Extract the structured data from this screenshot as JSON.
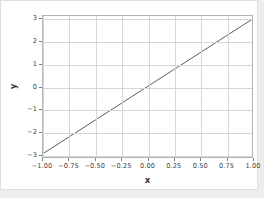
{
  "figure": {
    "background_color": "#ffffff",
    "page_background_color": "#ececed",
    "border_color": "#dededf"
  },
  "chart_data": {
    "type": "line",
    "title": "",
    "xlabel": "x",
    "ylabel": "y",
    "xlim": [
      -1.0,
      1.0
    ],
    "ylim": [
      -3.15,
      3.15
    ],
    "grid": true,
    "legend": null,
    "xticks": [
      -1.0,
      -0.75,
      -0.5,
      -0.25,
      0.0,
      0.25,
      0.5,
      0.75,
      1.0
    ],
    "xticklabels": [
      "−1.00",
      "−0.75",
      "−0.50",
      "−0.25",
      "0.00",
      "0.25",
      "0.50",
      "0.75",
      "1.00"
    ],
    "yticks": [
      3,
      2,
      1,
      0,
      -1,
      -2,
      -3
    ],
    "yticklabels": [
      "3",
      "2",
      "1",
      "0",
      "−1",
      "−2",
      "−3"
    ],
    "series": [
      {
        "name": "y = 3x",
        "color": "#5a5a5a",
        "linewidth": 1,
        "x": [
          -1.0,
          -0.75,
          -0.5,
          -0.25,
          0.0,
          0.25,
          0.5,
          0.75,
          1.0
        ],
        "values": [
          -3.0,
          -2.25,
          -1.5,
          -0.75,
          0.0,
          0.75,
          1.5,
          2.25,
          3.0
        ]
      }
    ],
    "grid_color": "#d6d6d6",
    "axis_color": "#b3b3b3",
    "tick_color": "#7f7f7f",
    "tick_label_color": "#3f3f3f"
  }
}
